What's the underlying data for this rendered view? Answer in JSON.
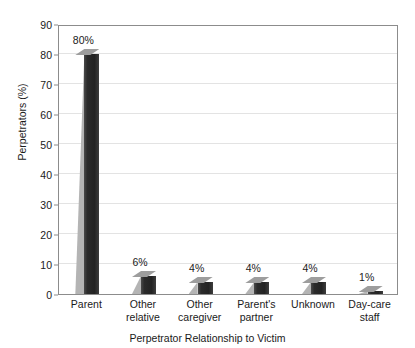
{
  "chart_data": {
    "type": "bar",
    "title": "",
    "xlabel": "Perpetrator Relationship to Victim",
    "ylabel": "Perpetrators (%)",
    "categories": [
      "Parent",
      "Other relative",
      "Other caregiver",
      "Parent's partner",
      "Unknown",
      "Day-care staff"
    ],
    "values": [
      80,
      6,
      4,
      4,
      4,
      1
    ],
    "data_labels": [
      "80%",
      "6%",
      "4%",
      "4%",
      "4%",
      "1%"
    ],
    "ylim": [
      0,
      90
    ],
    "yticks": [
      0,
      10,
      20,
      30,
      40,
      50,
      60,
      70,
      80,
      90
    ],
    "ytick_labels": [
      "0",
      "10",
      "20",
      "30",
      "40",
      "50",
      "60",
      "70",
      "80",
      "90"
    ],
    "grid": true,
    "legend": false,
    "legend_position": "none",
    "bar_style": "3d-column",
    "colors": {
      "bar_front": "#2b2b2b",
      "bar_side": "#b4b4b4",
      "bar_top": "#9d9d9d",
      "gridline": "#e3e3e3",
      "axis": "#8c8c8c",
      "text": "#1a1a1a",
      "background": "#ffffff"
    }
  },
  "axes": {
    "x_title": "Perpetrator Relationship to Victim",
    "y_title": "Perpetrators (%)"
  },
  "category_label_lines": [
    [
      "Parent"
    ],
    [
      "Other",
      "relative"
    ],
    [
      "Other",
      "caregiver"
    ],
    [
      "Parent's",
      "partner"
    ],
    [
      "Unknown"
    ],
    [
      "Day-care",
      "staff"
    ]
  ],
  "title_remnant": "· ·                                                  ·   ·"
}
